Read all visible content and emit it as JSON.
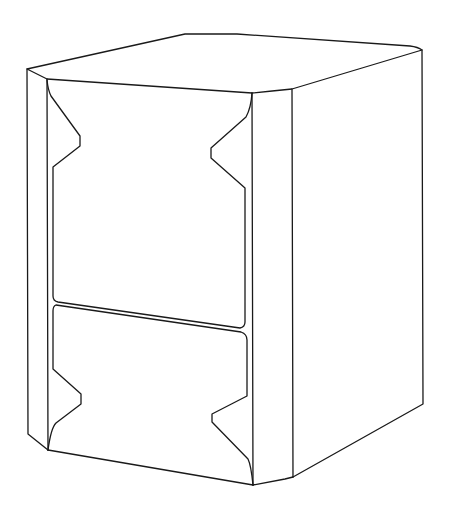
{
  "figure": {
    "background": "#ffffff",
    "stroke_color": "#1a1a1a",
    "width": 453,
    "height": 513
  },
  "parts": [
    {
      "name": "top-face"
    },
    {
      "name": "left-chamfer-face"
    },
    {
      "name": "front-upper-panel"
    },
    {
      "name": "front-lower-panel"
    },
    {
      "name": "right-chamfer-face"
    },
    {
      "name": "right-side-face"
    }
  ]
}
